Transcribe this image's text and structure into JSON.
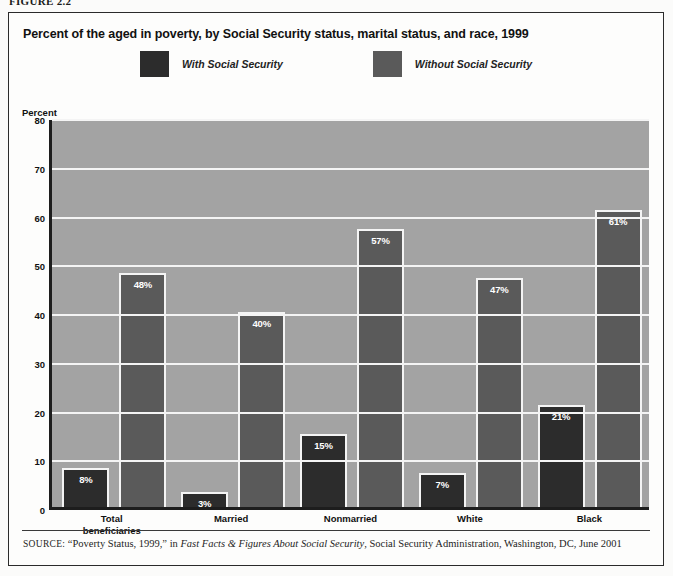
{
  "figure_label": "FIGURE 2.2",
  "chart_title": "Percent of the aged in poverty, by Social Security status, marital status, and race, 1999",
  "legend": {
    "items": [
      {
        "label": "With Social Security",
        "color": "#2c2c2c",
        "swatch_name": "legend-swatch-with-social-security"
      },
      {
        "label": "Without Social Security",
        "color": "#5a5a5a",
        "swatch_name": "legend-swatch-without-social-security"
      }
    ]
  },
  "source": {
    "prefix": "SOURCE:",
    "part1": " “Poverty Status, 1999,” in ",
    "italic": "Fast Facts & Figures About Social Security",
    "part2": ", Social Security Administration, Washington, DC, June 2001"
  },
  "chart_data": {
    "type": "bar",
    "title": "Percent of the aged in poverty, by Social Security status, marital status, and race, 1999",
    "xlabel": "",
    "ylabel": "Percent",
    "ylim": [
      0,
      80
    ],
    "yticks": [
      0,
      10,
      20,
      30,
      40,
      50,
      60,
      70,
      80
    ],
    "ytick_labels": [
      "0",
      "10",
      "20",
      "30",
      "40",
      "50",
      "60",
      "70",
      "80"
    ],
    "grid": true,
    "legend_position": "top-center",
    "categories": [
      "Total beneficiaries",
      "Married",
      "Nonmarried",
      "White",
      "Black"
    ],
    "category_lines": [
      [
        "Total",
        "beneficiaries"
      ],
      [
        "Married"
      ],
      [
        "Nonmarried"
      ],
      [
        "White"
      ],
      [
        "Black"
      ]
    ],
    "series": [
      {
        "name": "With Social Security",
        "color": "#2c2c2c",
        "values": [
          8,
          3,
          15,
          7,
          21
        ],
        "labels": [
          "8%",
          "3%",
          "15%",
          "7%",
          "21%"
        ]
      },
      {
        "name": "Without Social Security",
        "color": "#5a5a5a",
        "values": [
          48,
          40,
          57,
          47,
          61
        ],
        "labels": [
          "48%",
          "40%",
          "57%",
          "47%",
          "61%"
        ]
      }
    ],
    "plot_background": "#a3a3a3",
    "gridline_color": "#f4f4f4"
  }
}
